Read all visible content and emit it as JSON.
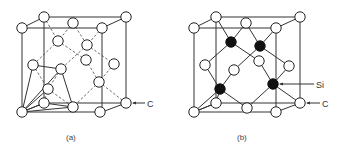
{
  "figure": {
    "panel_a": {
      "caption": "(a)",
      "labels": {
        "carbon": "C"
      },
      "description": "Diamond cubic lattice of carbon atoms with tetrahedral bonding highlighted"
    },
    "panel_b": {
      "caption": "(b)",
      "labels": {
        "silicon": "Si",
        "carbon": "C"
      },
      "description": "Silicon carbide (zinc blende) structure with Si atoms shaded black and C atoms white"
    }
  },
  "legend": {
    "atom_colors": {
      "C": "#ffffff",
      "Si": "#111111"
    }
  }
}
